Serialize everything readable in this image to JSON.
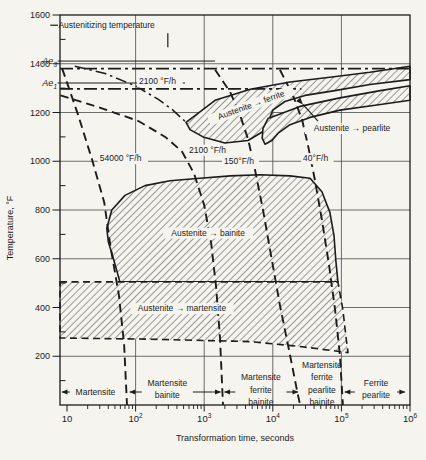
{
  "figure": {
    "colors": {
      "paper": "#f5f4ef",
      "ink": "#1c1c1c",
      "grid": "#4a4a4a",
      "hatch": "#3a3a3a"
    }
  },
  "chart_data": {
    "type": "line",
    "xlabel": "Transformation time, seconds",
    "ylabel": "Temperature, °F",
    "x_scale": "log",
    "x_range": [
      7.9,
      1000000
    ],
    "y_range": [
      0,
      1600
    ],
    "grid": {
      "vertical_t": [
        100,
        1000,
        10000,
        100000
      ],
      "horizontal_T": [
        1400,
        1200,
        1000,
        800,
        600,
        400,
        200
      ]
    },
    "x_axis": {
      "title": "Transformation time, seconds",
      "ticks": [
        {
          "t": 10,
          "base": "10",
          "sup": ""
        },
        {
          "t": 100,
          "base": "10",
          "sup": "2"
        },
        {
          "t": 1000,
          "base": "10",
          "sup": "3"
        },
        {
          "t": 10000,
          "base": "10",
          "sup": "4"
        },
        {
          "t": 100000,
          "base": "10",
          "sup": "5"
        },
        {
          "t": 1000000,
          "base": "10",
          "sup": "6"
        }
      ]
    },
    "y_axis": {
      "title": "Temperature, °F",
      "major_ticks": [
        1600,
        1400,
        1200,
        1000,
        800,
        600,
        400,
        200
      ],
      "minor_step": 100
    },
    "austenitizing": {
      "label": "Austenitizing temperature",
      "label_at": [
        7.5,
        1546
      ],
      "tick": [
        [
          5.7,
          1558
        ],
        [
          7.4,
          1558
        ]
      ],
      "leader": [
        [
          295,
          1525
        ],
        [
          295,
          1468
        ]
      ]
    },
    "reference_lines": [
      {
        "id": "Ae3",
        "label": "Ae",
        "sub": "3",
        "T": 1380,
        "span": [
          7.9,
          1000000
        ],
        "solid_seg": [
          [
            7.3,
            1411
          ],
          [
            1440,
            1411
          ]
        ]
      },
      {
        "id": "Ae1",
        "label": "Ae",
        "sub": "1",
        "T": 1297,
        "span": [
          7.9,
          26000
        ],
        "solid_seg": [
          [
            7.3,
            1321
          ],
          [
            525,
            1321
          ]
        ]
      }
    ],
    "upper_curve": {
      "label": "2100 °F/h",
      "label_at": [
        112,
        1315
      ],
      "points": [
        [
          13,
          1390
        ],
        [
          36,
          1360
        ],
        [
          98,
          1310
        ],
        [
          212,
          1255
        ],
        [
          350,
          1210
        ],
        [
          543,
          1160
        ]
      ]
    },
    "cooling_curves": [
      {
        "id": "rate-54000",
        "label": "54000 °F/h",
        "label_at": [
          30,
          1000
        ],
        "points": [
          [
            8.5,
            1380
          ],
          [
            14.5,
            1190
          ],
          [
            23,
            1010
          ],
          [
            35,
            830
          ],
          [
            43,
            650
          ],
          [
            57,
            450
          ],
          [
            68,
            250
          ],
          [
            75,
            0
          ]
        ]
      },
      {
        "id": "rate-2100",
        "label": "2100 °F/h",
        "label_at": [
          600,
          1035
        ],
        "points": [
          [
            8,
            1270
          ],
          [
            30,
            1220
          ],
          [
            110,
            1165
          ],
          [
            270,
            1100
          ],
          [
            475,
            1040
          ],
          [
            710,
            950
          ],
          [
            1000,
            820
          ],
          [
            1260,
            665
          ],
          [
            1490,
            485
          ],
          [
            1700,
            275
          ],
          [
            1880,
            0
          ]
        ]
      },
      {
        "id": "rate-150",
        "label": "150°F/h",
        "label_at": [
          1950,
          990
        ],
        "points": [
          [
            1440,
            1375
          ],
          [
            2380,
            1285
          ],
          [
            3330,
            1190
          ],
          [
            4360,
            1090
          ],
          [
            5500,
            965
          ],
          [
            7200,
            800
          ],
          [
            9400,
            615
          ],
          [
            12700,
            410
          ],
          [
            17800,
            205
          ],
          [
            22500,
            60
          ],
          [
            25000,
            0
          ]
        ]
      },
      {
        "id": "rate-40",
        "label": "40°F/h",
        "label_at": [
          27600,
          1000
        ],
        "points": [
          [
            12700,
            1375
          ],
          [
            19700,
            1270
          ],
          [
            26700,
            1170
          ],
          [
            32600,
            1065
          ],
          [
            41000,
            925
          ],
          [
            52000,
            760
          ],
          [
            66000,
            575
          ],
          [
            81000,
            390
          ],
          [
            95000,
            205
          ],
          [
            105000,
            0
          ]
        ]
      }
    ],
    "regions": [
      {
        "id": "ferrite",
        "label": "Austenite → ferrite",
        "label_at": [
          5000,
          1220
        ],
        "label_rotation": -20,
        "dashed": false,
        "points": [
          [
            543,
            1160
          ],
          [
            1440,
            1250
          ],
          [
            4700,
            1295
          ],
          [
            17800,
            1325
          ],
          [
            68000,
            1345
          ],
          [
            260000,
            1365
          ],
          [
            1000000,
            1390
          ],
          [
            1000000,
            1335
          ],
          [
            260000,
            1315
          ],
          [
            80000,
            1290
          ],
          [
            29500,
            1270
          ],
          [
            15000,
            1245
          ],
          [
            10000,
            1210
          ],
          [
            8500,
            1160
          ],
          [
            7000,
            1120
          ],
          [
            4350,
            1085
          ],
          [
            2000,
            1075
          ],
          [
            960,
            1100
          ],
          [
            620,
            1130
          ]
        ]
      },
      {
        "id": "pearlite",
        "label": "",
        "dashed": false,
        "points": [
          [
            8500,
            1175
          ],
          [
            25000,
            1225
          ],
          [
            95000,
            1260
          ],
          [
            370000,
            1290
          ],
          [
            1000000,
            1310
          ],
          [
            1000000,
            1250
          ],
          [
            310000,
            1230
          ],
          [
            95000,
            1210
          ],
          [
            35000,
            1180
          ],
          [
            17800,
            1150
          ],
          [
            12000,
            1115
          ],
          [
            9700,
            1085
          ],
          [
            7700,
            1070
          ],
          [
            7000,
            1095
          ],
          [
            7200,
            1135
          ]
        ]
      },
      {
        "id": "bainite",
        "label": "Austenite → bainite",
        "label_at": [
          1140,
          695
        ],
        "dashed": false,
        "points": [
          [
            38,
            725
          ],
          [
            45,
            800
          ],
          [
            70,
            860
          ],
          [
            137,
            900
          ],
          [
            317,
            920
          ],
          [
            870,
            930
          ],
          [
            2400,
            940
          ],
          [
            6500,
            945
          ],
          [
            17800,
            940
          ],
          [
            35000,
            930
          ],
          [
            52000,
            875
          ],
          [
            68000,
            790
          ],
          [
            78000,
            695
          ],
          [
            83000,
            595
          ],
          [
            89000,
            505
          ],
          [
            59,
            505
          ],
          [
            47,
            605
          ],
          [
            40,
            670
          ]
        ]
      },
      {
        "id": "martensite",
        "label": "Austenite → martensite",
        "label_at": [
          475,
          385
        ],
        "dashed": true,
        "points": [
          [
            7.9,
            505
          ],
          [
            89000,
            505
          ],
          [
            105000,
            390
          ],
          [
            117000,
            275
          ],
          [
            125000,
            215
          ],
          [
            25000,
            240
          ],
          [
            4700,
            260
          ],
          [
            160,
            270
          ],
          [
            7.9,
            275
          ]
        ]
      }
    ],
    "pearlite_pointer": {
      "label": "Austenite → pearlite",
      "label_at": [
        143000,
        1124
      ],
      "arrow": [
        [
          45600,
          1165
        ],
        [
          27500,
          1233
        ]
      ]
    },
    "bottom_zones": [
      {
        "lines": [
          "Martensite"
        ],
        "t0": 7.9,
        "t1": 77,
        "label_t": 26
      },
      {
        "lines": [
          "Martensite",
          "bainite"
        ],
        "t0": 77,
        "t1": 1850,
        "label_t": 290
      },
      {
        "lines": [
          "Martensite",
          "ferrite",
          "bainite"
        ],
        "t0": 1850,
        "t1": 24900,
        "label_t": 6700
      },
      {
        "lines": [
          "Martensite",
          "ferrite",
          "pearlite",
          "bainite"
        ],
        "t0": 24900,
        "t1": 105000,
        "label_t": 52000
      },
      {
        "lines": [
          "Ferrite",
          "pearlite"
        ],
        "t0": 105000,
        "t1": 900000,
        "label_t": 320000
      }
    ]
  }
}
